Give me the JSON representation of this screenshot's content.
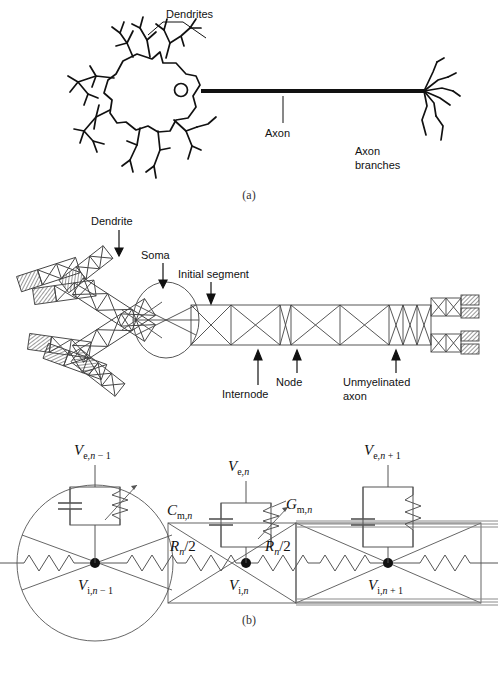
{
  "figure": {
    "panel_labels": {
      "a": "(a)",
      "b": "(b)",
      "c": "(c)"
    }
  },
  "panel_a": {
    "caption": "(a)",
    "labels": {
      "dendrites": "Dendrites",
      "axon": "Axon",
      "axon_branches_line1": "Axon",
      "axon_branches_line2": "branches"
    }
  },
  "panel_b": {
    "caption": "(b)",
    "labels": {
      "dendrite": "Dendrite",
      "soma": "Soma",
      "initial_segment": "Initial segment",
      "internode": "Internode",
      "node": "Node",
      "unmyelinated_line1": "Unmyelinated",
      "unmyelinated_line2": "axon"
    }
  },
  "panel_c": {
    "caption": "(c)",
    "labels": {
      "Ve_nm1": {
        "base": "V",
        "sub1": "e,",
        "sub2": "n",
        "sub3": " − 1"
      },
      "Ve_n": {
        "base": "V",
        "sub1": "e,",
        "sub2": "n",
        "sub3": ""
      },
      "Ve_np1": {
        "base": "V",
        "sub1": "e,",
        "sub2": "n",
        "sub3": " + 1"
      },
      "Cm_n": {
        "base": "C",
        "sub1": "m,",
        "sub2": "n",
        "sub3": ""
      },
      "Gm_n": {
        "base": "G",
        "sub1": "m,",
        "sub2": "n",
        "sub3": ""
      },
      "Vi_nm1": {
        "base": "V",
        "sub1": "i,",
        "sub2": "n",
        "sub3": " − 1"
      },
      "Vi_n": {
        "base": "V",
        "sub1": "i,",
        "sub2": "n",
        "sub3": ""
      },
      "Vi_np1": {
        "base": "V",
        "sub1": "i,",
        "sub2": "n",
        "sub3": " + 1"
      },
      "Rn_half_left": {
        "base": "R",
        "sub": "n",
        "tail": "/2"
      },
      "Rn_half_right": {
        "base": "R",
        "sub": "n",
        "tail": "/2"
      }
    },
    "text_plain": {
      "Ve_nm1": "Ve, n − 1",
      "Ve_n": "Ve, n",
      "Ve_np1": "Ve, n + 1",
      "Cm_n": "Cm, n",
      "Gm_n": "Gm, n",
      "Vi_nm1": "Vi, n − 1",
      "Vi_n": "Vi, n",
      "Vi_np1": "Vi, n + 1",
      "Rn_half": "Rn/2"
    }
  },
  "colors": {
    "ink": "#111111",
    "line": "#3a3a3a",
    "thin": "#555555",
    "myelin": "#8a8a8a",
    "white": "#ffffff"
  }
}
